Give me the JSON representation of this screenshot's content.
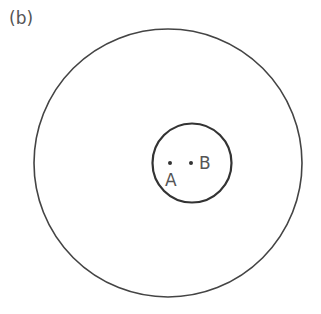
{
  "figure": {
    "panel_label": "(b)",
    "outer_circle": {
      "cx": 168,
      "cy": 163,
      "r": 134
    },
    "inner_circle": {
      "cx": 192,
      "cy": 163,
      "r": 40
    },
    "points": [
      {
        "name": "A",
        "x": 170,
        "y": 163
      },
      {
        "name": "B",
        "x": 191,
        "y": 163
      }
    ],
    "stroke_color": "#444444"
  }
}
